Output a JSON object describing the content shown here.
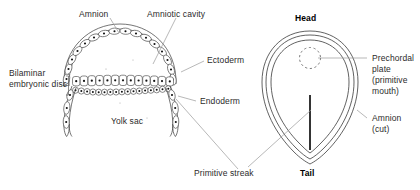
{
  "figure": {
    "stroke_color": "#3a3a3a",
    "leader_color": "#8c8c8c",
    "text_color": "#2b2b2b",
    "background": "#ffffff"
  },
  "labels": {
    "amnion": "Amnion",
    "amniotic_cavity": "Amniotic cavity",
    "ectoderm": "Ectoderm",
    "endoderm": "Endoderm",
    "bilaminar_line1": "Bilaminar",
    "bilaminar_line2": "embryonic disc",
    "yolk_sac": "Yolk sac",
    "primitive_streak": "Primitive streak",
    "head": "Head",
    "tail": "Tail",
    "prechordal_line1": "Prechordal",
    "prechordal_line2": "plate",
    "prechordal_line3": "(primitive",
    "prechordal_line4": "mouth)",
    "amnion_cut_line1": "Amnion",
    "amnion_cut_line2": "(cut)"
  }
}
